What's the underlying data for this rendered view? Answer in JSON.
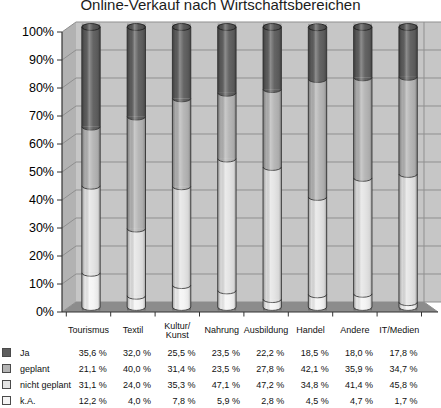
{
  "chart_data": {
    "type": "bar",
    "variant": "3d-cylinder-100pct-stacked",
    "title": "Online-Verkauf nach Wirtschaftsbereichen",
    "categories": [
      "Tourismus",
      "Textil",
      "Kultur/\nKunst",
      "Nahrung",
      "Ausbildung",
      "Handel",
      "Andere",
      "IT/Medien"
    ],
    "series": [
      {
        "name": "Ja",
        "color": "#5e5e5e",
        "values": [
          35.6,
          32.0,
          25.5,
          23.5,
          22.2,
          18.5,
          18.0,
          17.8
        ]
      },
      {
        "name": "geplant",
        "color": "#b4b4b4",
        "values": [
          21.1,
          40.0,
          31.4,
          23.5,
          27.8,
          42.1,
          35.9,
          34.7
        ]
      },
      {
        "name": "nicht geplant",
        "color": "#e3e3e3",
        "values": [
          31.1,
          24.0,
          35.3,
          47.1,
          47.2,
          34.8,
          41.4,
          45.8
        ]
      },
      {
        "name": "k.A.",
        "color": "#f4f4f4",
        "values": [
          12.2,
          4.0,
          7.8,
          5.9,
          2.8,
          4.5,
          4.7,
          1.7
        ]
      }
    ],
    "stack_order_bottom_to_top": [
      "k.A.",
      "nicht geplant",
      "geplant",
      "Ja"
    ],
    "xlabel": "",
    "ylabel": "",
    "ylim": [
      0,
      100
    ],
    "yticks": [
      "100%",
      "90%",
      "80%",
      "70%",
      "60%",
      "50%",
      "40%",
      "30%",
      "20%",
      "10%",
      "0%"
    ],
    "grid": true,
    "legend_position": "data-table-left"
  },
  "table": {
    "rows": [
      {
        "label": "Ja",
        "values": [
          "35,6 %",
          "32,0 %",
          "25,5 %",
          "23,5 %",
          "22,2 %",
          "18,5 %",
          "18,0 %",
          "17,8 %"
        ]
      },
      {
        "label": "geplant",
        "values": [
          "21,1 %",
          "40,0 %",
          "31,4 %",
          "23,5 %",
          "27,8 %",
          "42,1 %",
          "35,9 %",
          "34,7 %"
        ]
      },
      {
        "label": "nicht geplant",
        "values": [
          "31,1 %",
          "24,0 %",
          "35,3 %",
          "47,1 %",
          "47,2 %",
          "34,8 %",
          "41,4 %",
          "45,8 %"
        ]
      },
      {
        "label": "k.A.",
        "values": [
          "12,2 %",
          "4,0 %",
          "7,8 %",
          "5,9 %",
          "2,8 %",
          "4,5 %",
          "4,7 %",
          "1,7 %"
        ]
      }
    ]
  },
  "colors": {
    "back_wall": "#c6c6c6",
    "side_wall": "#b2b2b2",
    "floor": "#8c8c8c",
    "gridline": "#8f8f8f",
    "axis": "#333333",
    "cylinder_outline": "#3a3a3a",
    "cylinder_cap": "#545454",
    "title_text": "#1c1c1c"
  }
}
